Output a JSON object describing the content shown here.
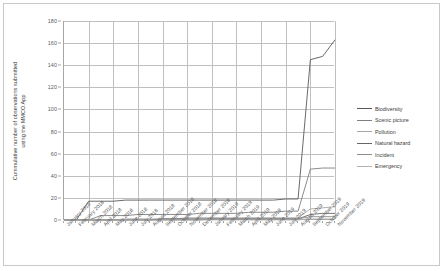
{
  "chart_data": {
    "type": "line",
    "title": "",
    "xlabel": "",
    "ylabel": "Cummulative number of observations submitted\nusing the MMCO App",
    "ylim": [
      0,
      180
    ],
    "yticks": [
      0,
      20,
      40,
      60,
      80,
      100,
      120,
      140,
      160,
      180
    ],
    "grid": true,
    "legend_position": "right",
    "categories": [
      "January 2018",
      "February 2018",
      "March 2018",
      "April 2018",
      "May 2018",
      "June 2018",
      "July 2018",
      "August 2018",
      "September 2018",
      "October 2018",
      "November 2018",
      "December 2018",
      "January 2019",
      "February 2019",
      "March 2019",
      "April 2019",
      "May 2019",
      "June 2019",
      "July 2019",
      "August 2019",
      "September 2019",
      "October 2019",
      "November 2019"
    ],
    "series": [
      {
        "name": "Biodiversity",
        "color": "#595959",
        "values": [
          0,
          0,
          17,
          17,
          17,
          18,
          18,
          18,
          18,
          18,
          18,
          18,
          18,
          18,
          18,
          18,
          18,
          18,
          19,
          19,
          145,
          148,
          163
        ]
      },
      {
        "name": "Scenic picture",
        "color": "#7f7f7f",
        "values": [
          0,
          0,
          0,
          4,
          4,
          4,
          5,
          5,
          5,
          5,
          5,
          6,
          6,
          6,
          6,
          7,
          7,
          7,
          8,
          8,
          46,
          47,
          47
        ]
      },
      {
        "name": "Pollution",
        "color": "#a6a6a6",
        "values": [
          0,
          0,
          0,
          0,
          0,
          1,
          1,
          1,
          1,
          1,
          2,
          2,
          2,
          2,
          2,
          2,
          2,
          2,
          2,
          2,
          10,
          11,
          12
        ]
      },
      {
        "name": "Natural hazard",
        "color": "#666666",
        "values": [
          0,
          0,
          0,
          0,
          0,
          0,
          0,
          0,
          1,
          1,
          1,
          1,
          1,
          1,
          1,
          1,
          1,
          1,
          1,
          1,
          5,
          6,
          6
        ]
      },
      {
        "name": "Incident",
        "color": "#8c8c8c",
        "values": [
          0,
          0,
          0,
          0,
          0,
          0,
          0,
          0,
          0,
          0,
          0,
          0,
          1,
          1,
          1,
          1,
          1,
          1,
          1,
          1,
          3,
          3,
          3
        ]
      },
      {
        "name": "Emergency",
        "color": "#b3b3b3",
        "values": [
          0,
          0,
          0,
          0,
          0,
          0,
          0,
          0,
          0,
          0,
          0,
          0,
          0,
          0,
          0,
          0,
          0,
          0,
          0,
          0,
          1,
          1,
          1
        ]
      }
    ]
  },
  "legend": {
    "items": [
      {
        "label": "Biodiversity"
      },
      {
        "label": "Scenic picture"
      },
      {
        "label": "Pollution"
      },
      {
        "label": "Natural hazard"
      },
      {
        "label": "Incident"
      },
      {
        "label": "Emergency"
      }
    ]
  },
  "axes": {
    "y_title": "Cummulative number of observations submitted\nusing the MMCO App"
  }
}
